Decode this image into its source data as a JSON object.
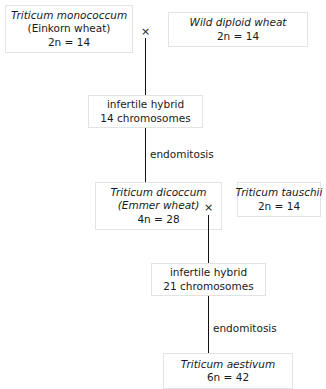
{
  "diagram": {
    "nodes": {
      "monococcum": {
        "line1": "Triticum monococcum",
        "line2": "(Einkorn wheat)",
        "line3": "2n = 14"
      },
      "wild_diploid": {
        "line1": "Wild diploid wheat",
        "line2": "2n = 14"
      },
      "hybrid_14": {
        "line1": "infertile hybrid",
        "line2": "14 chromosomes"
      },
      "dicoccum": {
        "line1": "Triticum dicoccum",
        "line2": "(Emmer wheat)",
        "line3": "4n = 28"
      },
      "tauschii": {
        "line1": "Triticum tauschii",
        "line2": "2n = 14"
      },
      "hybrid_21": {
        "line1": "infertile hybrid",
        "line2": "21 chromosomes"
      },
      "aestivum": {
        "line1": "Triticum aestivum",
        "line2": "6n = 42"
      }
    },
    "crosses": {
      "cross_1": "×",
      "cross_2": "×"
    },
    "edge_labels": {
      "endomitosis_1": "endomitosis",
      "endomitosis_2": "endomitosis"
    },
    "colors": {
      "background": "#ffffff",
      "text": "#1a1a1a",
      "box_border": "#e3e3e3",
      "connector": "#111111"
    }
  }
}
